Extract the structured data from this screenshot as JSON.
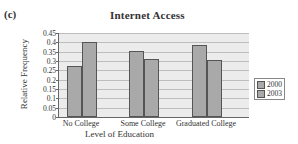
{
  "figure_label": "(c)",
  "chart_data": {
    "type": "bar",
    "title": "Internet Access",
    "xlabel": "Level of Education",
    "ylabel": "Relative Frequency",
    "categories": [
      "No College",
      "Some College",
      "Graduated College"
    ],
    "series": [
      {
        "name": "2000",
        "values": [
          0.275,
          0.355,
          0.385
        ]
      },
      {
        "name": "2003",
        "values": [
          0.4,
          0.31,
          0.305
        ]
      }
    ],
    "ylim": [
      0,
      0.45
    ],
    "yticks": [
      "0",
      "0.05",
      "0.1",
      "0.15",
      "0.2",
      "0.25",
      "0.3",
      "0.35",
      "0.4",
      "0.45"
    ],
    "grid": true,
    "legend_position": "right"
  }
}
